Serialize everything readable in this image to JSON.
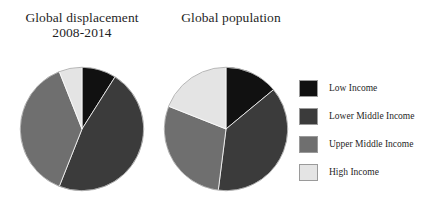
{
  "chart_data": [
    {
      "type": "pie",
      "name": "global-displacement",
      "title": "Global displacement\n2008-2014",
      "categories": [
        "Low Income",
        "Lower Middle Income",
        "Upper Middle Income",
        "High Income"
      ],
      "values": [
        9,
        47,
        38,
        6
      ],
      "unit": "percent",
      "start_angle": 0,
      "direction": "clockwise",
      "legend": "right",
      "grid": false
    },
    {
      "type": "pie",
      "name": "global-population",
      "title": "Global population",
      "categories": [
        "Low Income",
        "Lower Middle Income",
        "Upper Middle Income",
        "High Income"
      ],
      "values": [
        14,
        38,
        29,
        19
      ],
      "unit": "percent",
      "start_angle": 0,
      "direction": "clockwise",
      "legend": "right",
      "grid": false
    }
  ],
  "legend": {
    "entries": [
      {
        "label": "Low Income",
        "color": "#111111"
      },
      {
        "label": "Lower Middle Income",
        "color": "#3b3b3b"
      },
      {
        "label": "Upper Middle Income",
        "color": "#6f6f6f"
      },
      {
        "label": "High Income",
        "color": "#e4e4e4"
      }
    ]
  },
  "colors": {
    "low_income": "#111111",
    "lower_middle_income": "#3b3b3b",
    "upper_middle_income": "#6f6f6f",
    "high_income": "#e4e4e4",
    "background": "#ffffff",
    "text": "#1f1f1f",
    "slice_edge": "#ffffff"
  }
}
